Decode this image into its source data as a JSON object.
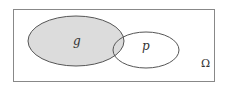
{
  "diagram": {
    "type": "venn",
    "universe": {
      "label": "Ω"
    },
    "sets": [
      {
        "id": "g",
        "label": "g",
        "shaded": true,
        "fill": "#dcdcdc"
      },
      {
        "id": "p",
        "label": "p",
        "shaded": false,
        "fill": "#ffffff"
      }
    ],
    "stroke_color": "#555555"
  }
}
